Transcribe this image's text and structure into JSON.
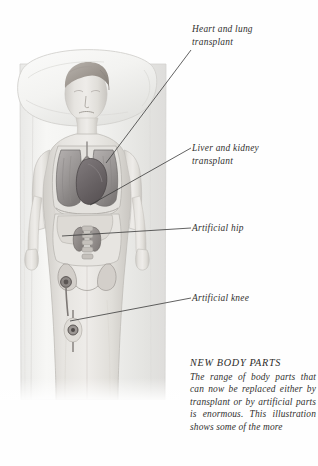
{
  "illustration": {
    "subject": "patient lying on bed with pillow, internal organs and joints shown",
    "alt": "anatomical illustration of a person supine showing heart, lungs, liver, kidneys, hip and knee joints"
  },
  "labels": {
    "heart_lung": "Heart and lung\ntransplant",
    "liver_kidney": "Liver and kidney\ntransplant",
    "artificial_hip": "Artificial hip",
    "artificial_knee": "Artificial knee"
  },
  "caption": {
    "title": "NEW BODY PARTS",
    "body": "The range of body parts that can now be replaced either by transplant or by artificial parts is enormous. This illustration shows some of the more"
  },
  "colors": {
    "text": "#31302e",
    "leader_line": "#3a3a3a",
    "page_background": "#fefefe",
    "bed_sheet": "#f2f2f0",
    "skin_tone": "#dedcd8",
    "organ_shadow": "#8f8b8a",
    "heart": "#6e6a6b"
  }
}
